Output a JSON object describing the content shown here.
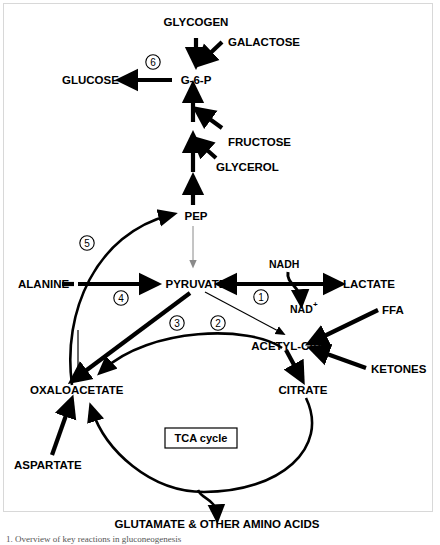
{
  "figure": {
    "title": "Overview of key reactions in gluconeogenesis",
    "caption": "1.   Overview of key reactions in gluconeogenesis",
    "background_color": "#ffffff",
    "line_color": "#000000",
    "hairline_color": "#8a8a8a",
    "frame_color": "#d8d8d8"
  },
  "metabolites": {
    "glycogen": "GLYCOGEN",
    "galactose": "GALACTOSE",
    "glucose": "GLUCOSE",
    "g6p": "G-6-P",
    "fructose": "FRUCTOSE",
    "glycerol": "GLYCEROL",
    "pep": "PEP",
    "alanine": "ALANINE",
    "pyruvate": "PYRUVATE",
    "lactate": "LACTATE",
    "acetyl_coa": "ACETYL-CoA",
    "ffa": "FFA",
    "ketones": "KETONES",
    "oxaloacetate": "OXALOACETATE",
    "citrate": "CITRATE",
    "aspartate": "ASPARTATE",
    "glutamate": "GLUTAMATE & OTHER AMINO ACIDS"
  },
  "cofactors": {
    "nadh": "NADH",
    "nad_plus_base": "NAD",
    "nad_plus_sup": "+"
  },
  "cycle": {
    "tca_label": "TCA cycle"
  },
  "steps": [
    {
      "id": "step-1",
      "number": "1",
      "reaction": "pyruvate-lactate"
    },
    {
      "id": "step-2",
      "number": "2",
      "reaction": "pyruvate-to-acetyl-coa"
    },
    {
      "id": "step-3",
      "number": "3",
      "reaction": "pyruvate-to-oxaloacetate"
    },
    {
      "id": "step-4",
      "number": "4",
      "reaction": "alanine-to-pyruvate"
    },
    {
      "id": "step-5",
      "number": "5",
      "reaction": "oxaloacetate-to-pep"
    },
    {
      "id": "step-6",
      "number": "6",
      "reaction": "g6p-to-glucose"
    }
  ]
}
